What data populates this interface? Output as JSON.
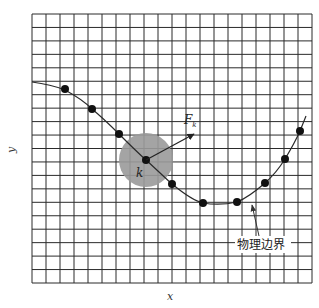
{
  "diagram": {
    "type": "grid-boundary-illustration",
    "grid": {
      "columns": 20,
      "rows": 20,
      "line_color": "#2a2a2a",
      "background": "#ffffff"
    },
    "axes": {
      "x_label": "x",
      "y_label": "y"
    },
    "boundary": {
      "label": "物理边界",
      "curve_color": "#2a2a2a",
      "points_count": 10
    },
    "focus_point": {
      "label": "k",
      "force_label_main": "F",
      "force_label_sub": "k",
      "influence_region_color": "#9a9a9a"
    }
  }
}
